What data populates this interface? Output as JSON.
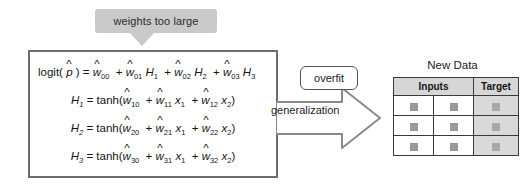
{
  "callout": {
    "text": "weights too large"
  },
  "model": {
    "equations": [
      {
        "id": "logit-equation",
        "text": "logit( p̂ ) = ŵ00 + ŵ01 H1 + ŵ02 H2 + ŵ03 H3"
      },
      {
        "id": "hidden-unit-1-equation",
        "text": "H1 = tanh(ŵ10 + ŵ11 x1 + ŵ12 x2)"
      },
      {
        "id": "hidden-unit-2-equation",
        "text": "H2 = tanh(ŵ20 + ŵ21 x1 + ŵ22 x2)"
      },
      {
        "id": "hidden-unit-3-equation",
        "text": "H3 = tanh(ŵ30 + ŵ31 x1 + ŵ32 x2)"
      }
    ]
  },
  "arrow": {
    "overfit_label": "overfit",
    "generalization_label": "generalization",
    "icon": "right-block-arrow-icon"
  },
  "table": {
    "title": "New Data",
    "headers": [
      "Inputs",
      "Target"
    ],
    "rows": [
      {
        "inputs": [
          "",
          ""
        ],
        "target": ""
      },
      {
        "inputs": [
          "",
          ""
        ],
        "target": ""
      },
      {
        "inputs": [
          "",
          ""
        ],
        "target": ""
      }
    ]
  },
  "colors": {
    "callout_bg": "#c9c9c9",
    "box_border": "#6e6e6e",
    "arrow_border": "#8a8a8a",
    "table_header_bg": "#d6d6d6",
    "target_cell_bg": "#d9d9d9",
    "swatch": "#9a9a9a",
    "page_bg": "#ffffff"
  }
}
